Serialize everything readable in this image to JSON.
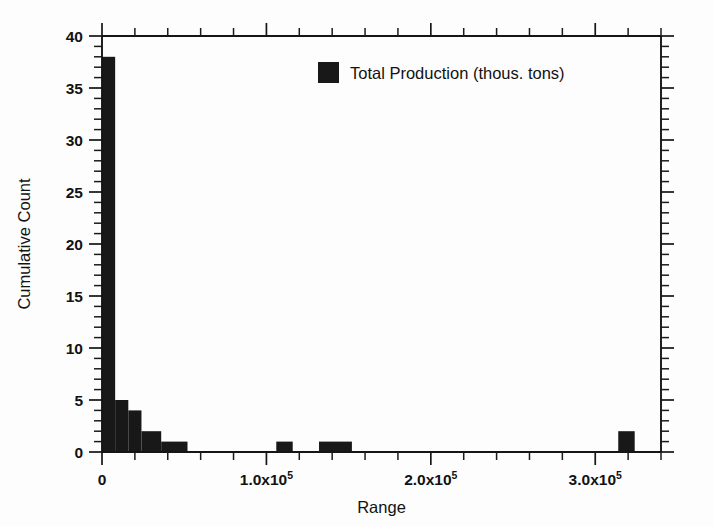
{
  "chart_data": {
    "type": "bar",
    "title": "",
    "xlabel": "Range",
    "ylabel": "Cumulative Count",
    "xlim": [
      0,
      340000
    ],
    "ylim": [
      0,
      40
    ],
    "grid": false,
    "legend_position": "top-center",
    "legend": [
      {
        "label": "Total Production (thous. tons)",
        "color": "#181818"
      }
    ],
    "x_ticks_major": [
      {
        "value": 0,
        "label": "0",
        "mantissa": "",
        "exponent": ""
      },
      {
        "value": 100000,
        "label": "1.0x10",
        "mantissa": "1.0x10",
        "exponent": "5"
      },
      {
        "value": 200000,
        "label": "2.0x10",
        "mantissa": "2.0x10",
        "exponent": "5"
      },
      {
        "value": 300000,
        "label": "3.0x10",
        "mantissa": "3.0x10",
        "exponent": "5"
      }
    ],
    "x_tick_minor_step": 20000,
    "y_ticks_major": [
      0,
      5,
      10,
      15,
      20,
      25,
      30,
      35,
      40
    ],
    "y_tick_minor_step": 1,
    "bars": [
      {
        "x_start": 0,
        "x_end": 8000,
        "value": 38
      },
      {
        "x_start": 8000,
        "x_end": 16000,
        "value": 5
      },
      {
        "x_start": 16000,
        "x_end": 24000,
        "value": 4
      },
      {
        "x_start": 24000,
        "x_end": 36000,
        "value": 2
      },
      {
        "x_start": 36000,
        "x_end": 52000,
        "value": 1
      },
      {
        "x_start": 106000,
        "x_end": 116000,
        "value": 1
      },
      {
        "x_start": 132000,
        "x_end": 152000,
        "value": 1
      },
      {
        "x_start": 314000,
        "x_end": 324000,
        "value": 2
      }
    ]
  },
  "axis_labels": {
    "y_title": "Cumulative Count",
    "x_title": "Range"
  },
  "colors": {
    "bar": "#181818",
    "axis": "#151515",
    "background": "#fdfdfd"
  }
}
